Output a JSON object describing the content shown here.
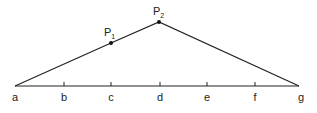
{
  "diagram": {
    "axis_labels": [
      "a",
      "b",
      "c",
      "d",
      "e",
      "f",
      "g"
    ],
    "points": [
      {
        "name": "P",
        "sub": "1",
        "position": "c"
      },
      {
        "name": "P",
        "sub": "2",
        "position": "d"
      }
    ],
    "colors": {
      "line": "#222222",
      "background": "#ffffff"
    }
  }
}
